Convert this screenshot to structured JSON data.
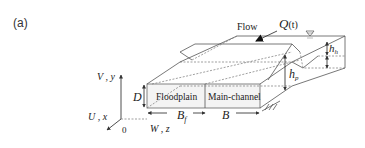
{
  "figure": {
    "panel_label": "(a)",
    "flow_label": "Flow",
    "discharge_symbol": "Q",
    "discharge_arg": "(t)",
    "water_surface_icon": "water-surface-triangle",
    "regions": {
      "floodplain": "Floodplain",
      "main_channel": "Main-channel"
    },
    "dimensions": {
      "depth": "D",
      "floodplain_width_base": "B",
      "floodplain_width_sub": "f",
      "total_width": "B",
      "bankfull_depth_base": "h",
      "bankfull_depth_sub": "p",
      "overbank_depth_base": "h",
      "overbank_depth_sub": "h"
    },
    "axes": {
      "vertical": "V , y",
      "streamwise": "U , x",
      "transverse": "W , z",
      "origin": "0"
    }
  }
}
